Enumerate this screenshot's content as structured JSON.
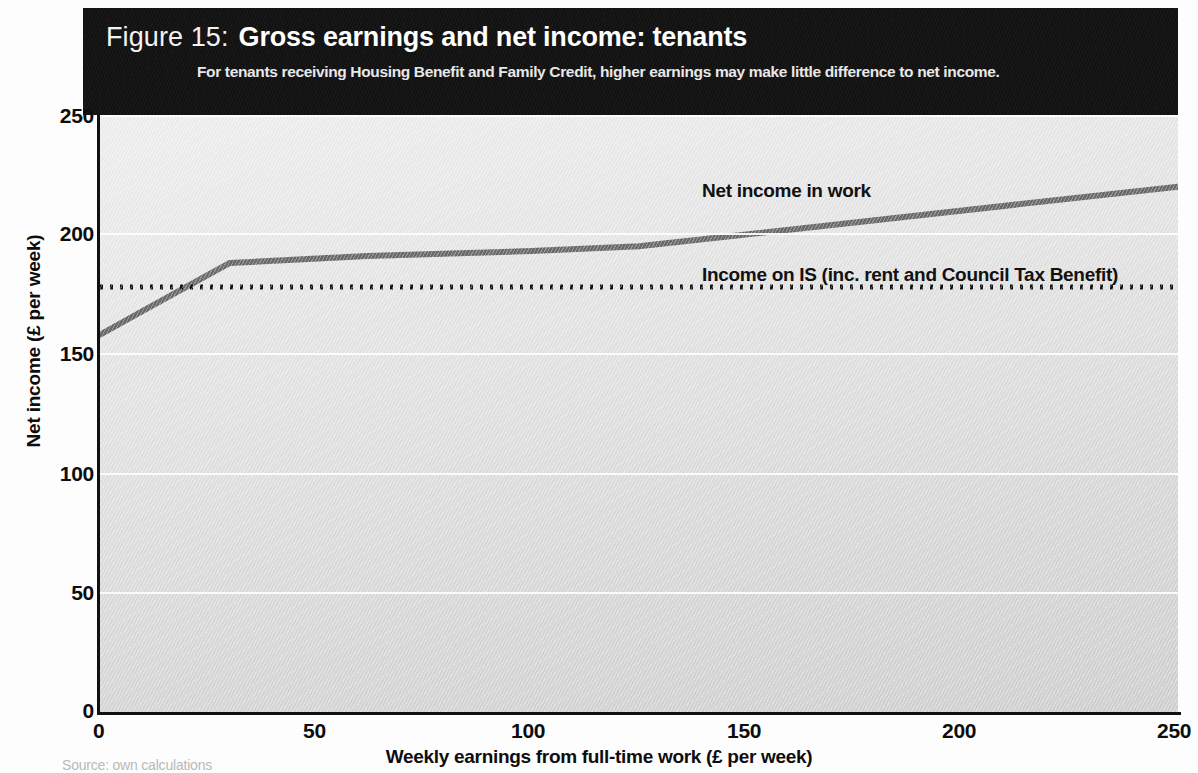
{
  "figure": {
    "number_label": "Figure 15:",
    "title": "Gross earnings and net income: tenants",
    "subtitle": "For tenants receiving Housing Benefit and Family Credit, higher earnings may make little difference to net income.",
    "source_note": "Source: own calculations"
  },
  "colors": {
    "header_background": "#121212",
    "header_text": "#ffffff",
    "plot_background_light": "#f1f1f1",
    "plot_background_dark": "#d2d2d2",
    "gridline": "#fcfcfc",
    "series_line": "#6b6b6b",
    "reference_line": "#111111",
    "axis": "#111111"
  },
  "chart_data": {
    "type": "line",
    "title": "Gross earnings and net income: tenants",
    "subtitle": "For tenants receiving Housing Benefit and Family Credit, higher earnings may make little difference to net income.",
    "xlabel": "Weekly earnings from full-time work (£ per week)",
    "ylabel": "Net income (£ per week)",
    "xlim": [
      0,
      250
    ],
    "ylim": [
      0,
      250
    ],
    "xticks": [
      0,
      50,
      100,
      150,
      200,
      250
    ],
    "yticks": [
      0,
      50,
      100,
      150,
      200,
      250
    ],
    "grid": "horizontal",
    "legend_position": "inline-annotations",
    "series": [
      {
        "name": "Net income in work",
        "style": "solid",
        "color": "#6b6b6b",
        "x": [
          0,
          24,
          30,
          62,
          100,
          125,
          175,
          250
        ],
        "values": [
          158,
          182,
          188,
          191,
          193,
          195,
          205,
          220
        ]
      },
      {
        "name": "Income on IS  (inc. rent and Council Tax Benefit)",
        "style": "dotted",
        "color": "#111111",
        "x": [
          0,
          250
        ],
        "values": [
          178,
          178
        ]
      }
    ],
    "annotations": [
      {
        "text": "Net income in work",
        "x": 140,
        "y": 213
      },
      {
        "text": "Income on IS  (inc. rent and Council Tax Benefit)",
        "x": 140,
        "y": 186
      }
    ]
  },
  "axes": {
    "y_label": "Net income (£ per week)",
    "x_label": "Weekly earnings from full-time work (£ per week)",
    "y_ticks": [
      "0",
      "50",
      "100",
      "150",
      "200",
      "250"
    ],
    "x_ticks": [
      "0",
      "50",
      "100",
      "150",
      "200",
      "250"
    ]
  },
  "annotations": {
    "net_income": "Net income in work",
    "income_on_is": "Income on IS  (inc. rent and Council Tax Benefit)"
  }
}
